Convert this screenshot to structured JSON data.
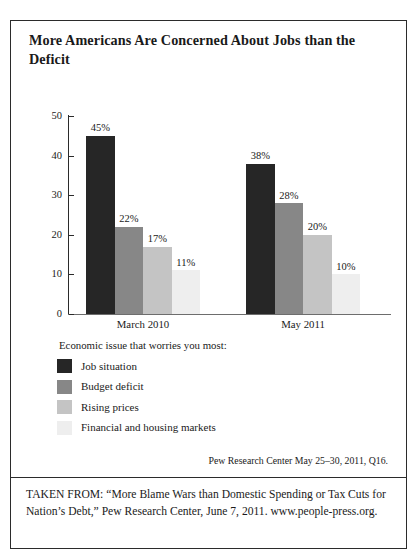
{
  "figure": {
    "title": "More Americans Are Concerned About Jobs than the Deficit",
    "legend_heading": "Economic issue that worries you most:",
    "source_note": "Pew Research Center May 25–30, 2011, Q16.",
    "caption": "TAKEN FROM: “More Blame Wars than Domestic Spending or Tax Cuts for Nation’s Debt,” Pew Research Center, June 7, 2011. www.people-press.org."
  },
  "chart_data": {
    "type": "bar",
    "title": "More Americans Are Concerned About Jobs than the Deficit",
    "xlabel": "",
    "ylabel": "",
    "ylim": [
      0,
      50
    ],
    "yticks": [
      0,
      10,
      20,
      30,
      40,
      50
    ],
    "ytick_labels": [
      "0",
      "10",
      "20",
      "30",
      "40",
      "50"
    ],
    "grid": false,
    "legend_position": "below-plot",
    "categories": [
      "March 2010",
      "May 2011"
    ],
    "series": [
      {
        "name": "Job situation",
        "color": "#262626",
        "values": [
          45,
          38
        ],
        "data_labels": [
          "45%",
          "38%"
        ]
      },
      {
        "name": "Budget deficit",
        "color": "#878787",
        "values": [
          22,
          28
        ],
        "data_labels": [
          "22%",
          "28%"
        ]
      },
      {
        "name": "Rising prices",
        "color": "#c4c4c4",
        "values": [
          17,
          20
        ],
        "data_labels": [
          "17%",
          "20%"
        ]
      },
      {
        "name": "Financial and housing markets",
        "color": "#eeeeee",
        "values": [
          11,
          10
        ],
        "data_labels": [
          "11%",
          "10%"
        ]
      }
    ]
  }
}
